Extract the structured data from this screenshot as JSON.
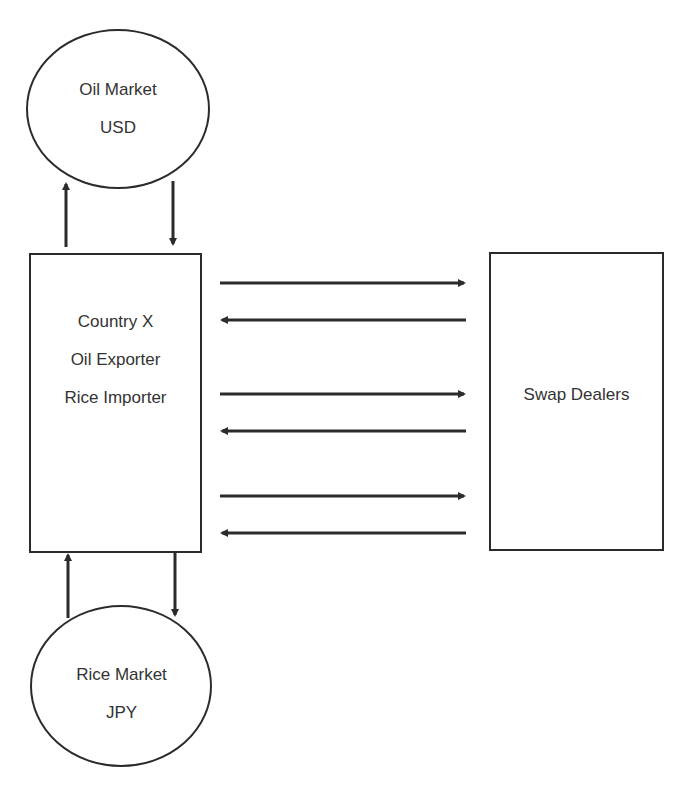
{
  "nodes": {
    "oil_market": {
      "lines": [
        "Oil Market",
        "USD"
      ]
    },
    "country": {
      "lines": [
        "Country X",
        "Oil Exporter",
        "Rice Importer"
      ]
    },
    "swap_dealers": {
      "lines": [
        "Swap Dealers"
      ]
    },
    "rice_market": {
      "lines": [
        "Rice Market",
        "JPY"
      ]
    }
  },
  "edges": [
    {
      "from": "country",
      "to": "oil_market"
    },
    {
      "from": "oil_market",
      "to": "country"
    },
    {
      "from": "country",
      "to": "swap_dealers"
    },
    {
      "from": "swap_dealers",
      "to": "country"
    },
    {
      "from": "country",
      "to": "swap_dealers"
    },
    {
      "from": "swap_dealers",
      "to": "country"
    },
    {
      "from": "country",
      "to": "swap_dealers"
    },
    {
      "from": "swap_dealers",
      "to": "country"
    },
    {
      "from": "rice_market",
      "to": "country"
    },
    {
      "from": "country",
      "to": "rice_market"
    }
  ],
  "colors": {
    "stroke": "#2b2b2b",
    "background": "#ffffff"
  }
}
